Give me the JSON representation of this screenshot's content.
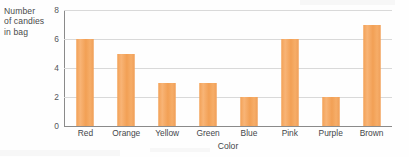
{
  "chart_data": {
    "type": "bar",
    "title": "",
    "xlabel": "Color",
    "ylabel": "Number\nof candies\nin bag",
    "categories": [
      "Red",
      "Orange",
      "Yellow",
      "Green",
      "Blue",
      "Pink",
      "Purple",
      "Brown"
    ],
    "values": [
      6,
      5,
      3,
      3,
      2,
      6,
      2,
      7
    ],
    "ylim": [
      0,
      8
    ],
    "yticks": [
      0,
      2,
      4,
      6,
      8
    ],
    "ytick_labels": [
      "0",
      "2",
      "4",
      "6",
      "8"
    ],
    "grid": true,
    "legend": "none",
    "bar_color": "#f5a85e",
    "axis_color": "#8a8a8a",
    "grid_color": "#d9d9d9",
    "text_color": "#44464a"
  }
}
